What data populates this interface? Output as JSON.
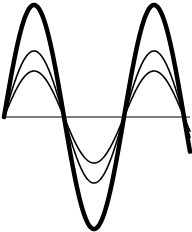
{
  "diagram": {
    "type": "waveforms",
    "colors": {
      "background": "#ffffff",
      "wave": "#000000",
      "baseline": "#555555"
    },
    "baseline": {
      "y": 117,
      "x_start": 4,
      "x_end": 190
    },
    "period_px": 120,
    "x_start": 4,
    "waves": [
      {
        "name": "large-amplitude",
        "amplitude_px": 112,
        "stroke_width": 4.5
      },
      {
        "name": "medium-amplitude",
        "amplitude_px": 66,
        "stroke_width": 1.6
      },
      {
        "name": "small-amplitude",
        "amplitude_px": 46,
        "stroke_width": 1.6
      }
    ]
  }
}
